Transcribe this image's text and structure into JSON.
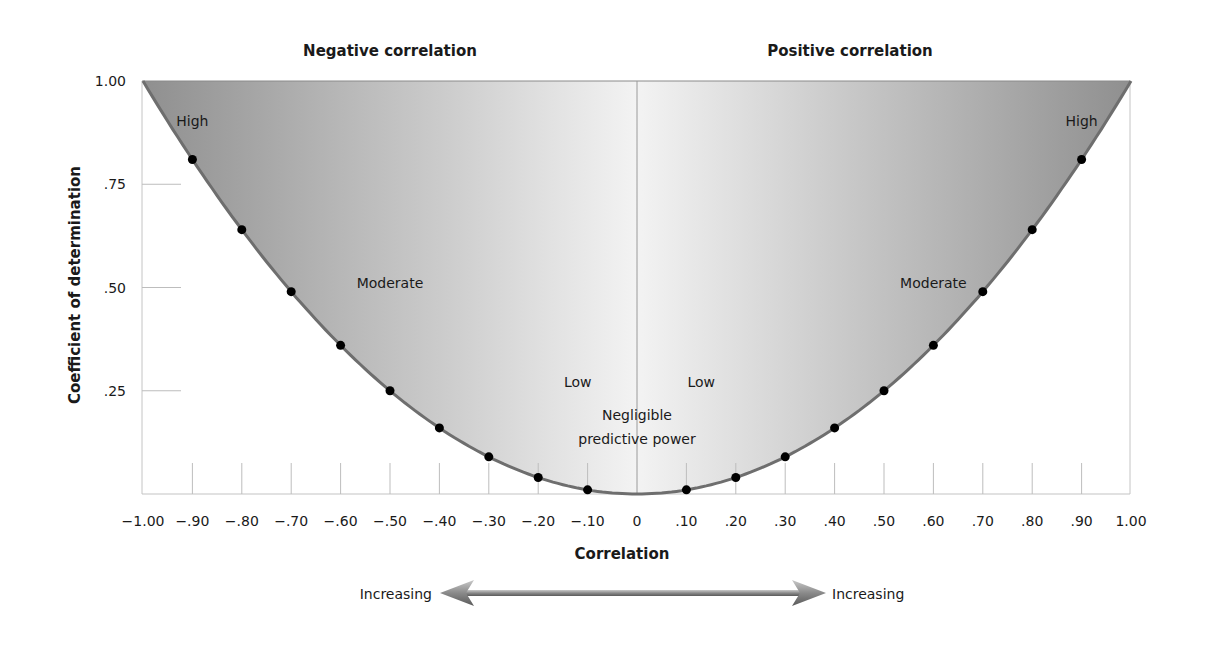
{
  "chart_data": {
    "type": "line",
    "title": "",
    "xlabel": "Correlation",
    "ylabel": "Coefficient of determination",
    "xlim": [
      -1.0,
      1.0
    ],
    "ylim": [
      0,
      1.0
    ],
    "x_ticks": [
      {
        "value": -1.0,
        "label": "−1.00"
      },
      {
        "value": -0.9,
        "label": "−.90"
      },
      {
        "value": -0.8,
        "label": "−.80"
      },
      {
        "value": -0.7,
        "label": "−.70"
      },
      {
        "value": -0.6,
        "label": "−.60"
      },
      {
        "value": -0.5,
        "label": "−.50"
      },
      {
        "value": -0.4,
        "label": "−.40"
      },
      {
        "value": -0.3,
        "label": "−.30"
      },
      {
        "value": -0.2,
        "label": "−.20"
      },
      {
        "value": -0.1,
        "label": "−.10"
      },
      {
        "value": 0.0,
        "label": "0"
      },
      {
        "value": 0.1,
        "label": ".10"
      },
      {
        "value": 0.2,
        "label": ".20"
      },
      {
        "value": 0.3,
        "label": ".30"
      },
      {
        "value": 0.4,
        "label": ".40"
      },
      {
        "value": 0.5,
        "label": ".50"
      },
      {
        "value": 0.6,
        "label": ".60"
      },
      {
        "value": 0.7,
        "label": ".70"
      },
      {
        "value": 0.8,
        "label": ".80"
      },
      {
        "value": 0.9,
        "label": ".90"
      },
      {
        "value": 1.0,
        "label": "1.00"
      }
    ],
    "y_ticks": [
      {
        "value": 1.0,
        "label": "1.00"
      },
      {
        "value": 0.75,
        "label": ".75"
      },
      {
        "value": 0.5,
        "label": ".50"
      },
      {
        "value": 0.25,
        "label": ".25"
      }
    ],
    "series": [
      {
        "name": "Coefficient of determination (r squared)",
        "x": [
          -0.9,
          -0.8,
          -0.7,
          -0.6,
          -0.5,
          -0.4,
          -0.3,
          -0.2,
          -0.1,
          0.1,
          0.2,
          0.3,
          0.4,
          0.5,
          0.6,
          0.7,
          0.8,
          0.9
        ],
        "y": [
          0.81,
          0.64,
          0.49,
          0.36,
          0.25,
          0.16,
          0.09,
          0.04,
          0.01,
          0.01,
          0.04,
          0.09,
          0.16,
          0.25,
          0.36,
          0.49,
          0.64,
          0.81
        ]
      }
    ],
    "section_titles": {
      "left": "Negative correlation",
      "right": "Positive correlation"
    },
    "annotations": [
      {
        "text": "High",
        "r": -0.9,
        "y": 0.89
      },
      {
        "text": "High",
        "r": 0.9,
        "y": 0.89
      },
      {
        "text": "Moderate",
        "r": -0.5,
        "y": 0.5
      },
      {
        "text": "Moderate",
        "r": 0.6,
        "y": 0.5
      },
      {
        "text": "Low",
        "r": -0.12,
        "y": 0.26
      },
      {
        "text": "Low",
        "r": 0.13,
        "y": 0.26
      },
      {
        "text": "Negligible",
        "r": 0.0,
        "y": 0.18
      },
      {
        "text": "predictive power",
        "r": 0.0,
        "y": 0.12
      }
    ],
    "arrow": {
      "left_label": "Increasing",
      "right_label": "Increasing"
    },
    "grid": false,
    "colors": {
      "fill_dark": "#9a9a9a",
      "fill_light": "#f2f2f2",
      "curve": "#707070",
      "dot": "#000000",
      "frame": "#bdbdbd"
    }
  }
}
